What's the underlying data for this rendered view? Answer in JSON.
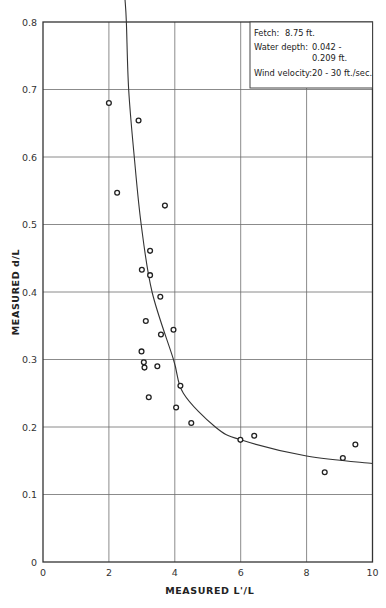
{
  "chart_data": {
    "type": "scatter",
    "title": "",
    "xlabel": "MEASURED L'/L",
    "ylabel": "MEASURED d/L",
    "xlim": [
      0,
      10
    ],
    "ylim": [
      0,
      0.8
    ],
    "x_ticks": [
      0,
      2,
      4,
      6,
      8,
      10
    ],
    "x_tick_labels": [
      "0",
      "2",
      "4",
      "6",
      "8",
      "10"
    ],
    "y_ticks": [
      0,
      0.1,
      0.2,
      0.3,
      0.4,
      0.5,
      0.6,
      0.7,
      0.8
    ],
    "y_tick_labels": [
      "0",
      "0.1",
      "0.2",
      "0.3",
      "0.4",
      "0.5",
      "0.6",
      "0.7",
      "0.8"
    ],
    "grid": true,
    "legend_position": "top-right",
    "annotation": {
      "lines": [
        {
          "label": "Fetch:",
          "value": "8.75 ft."
        },
        {
          "label": "Water depth:",
          "value": "0.042 -"
        },
        {
          "label": "",
          "value": "0.209 ft."
        },
        {
          "label": "Wind velocity:",
          "value": "20 - 30 ft./sec."
        }
      ]
    },
    "series": [
      {
        "name": "Measured data",
        "kind": "scatter",
        "marker": "open-circle",
        "points": [
          [
            2.0,
            0.68
          ],
          [
            2.9,
            0.654
          ],
          [
            2.25,
            0.547
          ],
          [
            3.7,
            0.528
          ],
          [
            3.25,
            0.461
          ],
          [
            3.0,
            0.433
          ],
          [
            3.25,
            0.425
          ],
          [
            3.56,
            0.393
          ],
          [
            3.12,
            0.357
          ],
          [
            3.96,
            0.344
          ],
          [
            3.58,
            0.337
          ],
          [
            2.99,
            0.312
          ],
          [
            3.06,
            0.296
          ],
          [
            3.08,
            0.288
          ],
          [
            3.47,
            0.29
          ],
          [
            4.17,
            0.261
          ],
          [
            3.21,
            0.244
          ],
          [
            4.04,
            0.229
          ],
          [
            4.5,
            0.206
          ],
          [
            5.99,
            0.181
          ],
          [
            6.41,
            0.187
          ],
          [
            8.55,
            0.133
          ],
          [
            9.1,
            0.154
          ],
          [
            9.48,
            0.174
          ]
        ]
      },
      {
        "name": "Fitted curve",
        "kind": "line",
        "points": [
          [
            2.53,
            0.8
          ],
          [
            2.6,
            0.7
          ],
          [
            2.77,
            0.6
          ],
          [
            2.98,
            0.5
          ],
          [
            3.31,
            0.4
          ],
          [
            3.96,
            0.3
          ],
          [
            4.26,
            0.25
          ],
          [
            5.23,
            0.2
          ],
          [
            6.0,
            0.181
          ],
          [
            8.0,
            0.157
          ],
          [
            10.0,
            0.146
          ]
        ]
      }
    ]
  }
}
